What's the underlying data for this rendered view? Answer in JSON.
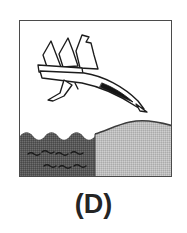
{
  "figure": {
    "caption": "(D)",
    "panel": {
      "border_color": "#4b4b4b",
      "background_color": "#ffffff",
      "width": 153,
      "height": 157
    },
    "scene": {
      "description": "Line drawing of a jet aircraft in a steep nose-down dive toward the boundary between water on the left and a sloping hill of land on the right",
      "aircraft": {
        "name": "jet-aircraft",
        "style": "black outline line-art, white fill",
        "attitude": "nose-down, diving to the lower right",
        "outline_color": "#1c1c1c",
        "fill_color": "#ffffff",
        "shadow_color": "#151515",
        "parts": [
          "fuselage",
          "nose",
          "swept-wing",
          "vertical-tail-fin",
          "second-fin",
          "ventral-fin",
          "canopy-shadow"
        ]
      },
      "water": {
        "name": "water",
        "color": "#5c5c5c",
        "texture": "dithered halftone",
        "top_edge": "wavy scalloped line",
        "wave_marks": 7,
        "wave_mark_color": "#1e1e1e"
      },
      "land": {
        "name": "land-hill",
        "color": "#bcbcbc",
        "texture": "dithered halftone",
        "outline_color": "#3a3a3a",
        "shape": "rounded hill rising to the right"
      }
    }
  }
}
